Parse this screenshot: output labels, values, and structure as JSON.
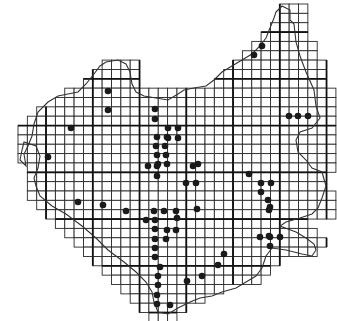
{
  "map": {
    "type": "grid-distribution-map",
    "background": "#ffffff",
    "grid_color": "#2a2a2a",
    "dot_color": "#1a1a1a",
    "grid": {
      "origin_x": 18,
      "origin_y": 4,
      "cell": 9.35,
      "major_every": 5,
      "rows": [
        {
          "row": 0,
          "from_col": 28,
          "to_col": 30
        },
        {
          "row": 1,
          "from_col": 28,
          "to_col": 30
        },
        {
          "row": 2,
          "from_col": 27,
          "to_col": 30
        },
        {
          "row": 3,
          "from_col": 26,
          "to_col": 30
        },
        {
          "row": 4,
          "from_col": 25,
          "to_col": 31
        },
        {
          "row": 5,
          "from_col": 24,
          "to_col": 31
        },
        {
          "row": 6,
          "from_col": 9,
          "to_col": 12
        },
        {
          "row": 6,
          "from_col": 23,
          "to_col": 32
        },
        {
          "row": 7,
          "from_col": 8,
          "to_col": 12
        },
        {
          "row": 7,
          "from_col": 22,
          "to_col": 32
        },
        {
          "row": 8,
          "from_col": 7,
          "to_col": 12
        },
        {
          "row": 8,
          "from_col": 21,
          "to_col": 32
        },
        {
          "row": 9,
          "from_col": 5,
          "to_col": 33
        },
        {
          "row": 10,
          "from_col": 4,
          "to_col": 33
        },
        {
          "row": 11,
          "from_col": 2,
          "to_col": 33
        },
        {
          "row": 12,
          "from_col": 1,
          "to_col": 33
        },
        {
          "row": 13,
          "from_col": 0,
          "to_col": 33
        },
        {
          "row": 14,
          "from_col": 0,
          "to_col": 33
        },
        {
          "row": 15,
          "from_col": 0,
          "to_col": 33
        },
        {
          "row": 16,
          "from_col": 0,
          "to_col": 33
        },
        {
          "row": 17,
          "from_col": 1,
          "to_col": 33
        },
        {
          "row": 18,
          "from_col": 1,
          "to_col": 32
        },
        {
          "row": 19,
          "from_col": 1,
          "to_col": 32
        },
        {
          "row": 20,
          "from_col": 1,
          "to_col": 33
        },
        {
          "row": 21,
          "from_col": 2,
          "to_col": 33
        },
        {
          "row": 22,
          "from_col": 3,
          "to_col": 33
        },
        {
          "row": 23,
          "from_col": 4,
          "to_col": 30
        },
        {
          "row": 24,
          "from_col": 5,
          "to_col": 31
        },
        {
          "row": 25,
          "from_col": 6,
          "to_col": 32
        },
        {
          "row": 26,
          "from_col": 7,
          "to_col": 31
        },
        {
          "row": 27,
          "from_col": 8,
          "to_col": 27
        },
        {
          "row": 28,
          "from_col": 9,
          "to_col": 26
        },
        {
          "row": 29,
          "from_col": 10,
          "to_col": 25
        },
        {
          "row": 30,
          "from_col": 11,
          "to_col": 21
        },
        {
          "row": 31,
          "from_col": 12,
          "to_col": 19
        },
        {
          "row": 32,
          "from_col": 13,
          "to_col": 17
        },
        {
          "row": 33,
          "from_col": 14,
          "to_col": 16
        }
      ]
    },
    "dots": [
      [
        262,
        46
      ],
      [
        254,
        55
      ],
      [
        108,
        91
      ],
      [
        108,
        110
      ],
      [
        71,
        128
      ],
      [
        168,
        128
      ],
      [
        155,
        109
      ],
      [
        155,
        119
      ],
      [
        178,
        128
      ],
      [
        168,
        138
      ],
      [
        178,
        138
      ],
      [
        157,
        137
      ],
      [
        167,
        137
      ],
      [
        156,
        146
      ],
      [
        165,
        146
      ],
      [
        157,
        155
      ],
      [
        166,
        155
      ],
      [
        158,
        164
      ],
      [
        167,
        164
      ],
      [
        148,
        166
      ],
      [
        157,
        166
      ],
      [
        157,
        176
      ],
      [
        198,
        164
      ],
      [
        48,
        157
      ],
      [
        289,
        116
      ],
      [
        298,
        116
      ],
      [
        308,
        116
      ],
      [
        249,
        174
      ],
      [
        186,
        183
      ],
      [
        196,
        183
      ],
      [
        261,
        183
      ],
      [
        271,
        183
      ],
      [
        261,
        192
      ],
      [
        78,
        202
      ],
      [
        126,
        211
      ],
      [
        154,
        211
      ],
      [
        164,
        211
      ],
      [
        176,
        211
      ],
      [
        146,
        220
      ],
      [
        155,
        220
      ],
      [
        155,
        229
      ],
      [
        197,
        209
      ],
      [
        155,
        239
      ],
      [
        166,
        239
      ],
      [
        177,
        218
      ],
      [
        155,
        248
      ],
      [
        155,
        257
      ],
      [
        176,
        230
      ],
      [
        167,
        230
      ],
      [
        268,
        200
      ],
      [
        270,
        207
      ],
      [
        269,
        236
      ],
      [
        270,
        246
      ],
      [
        269,
        210
      ],
      [
        160,
        267
      ],
      [
        158,
        276
      ],
      [
        158,
        285
      ],
      [
        157,
        295
      ],
      [
        157,
        304
      ],
      [
        260,
        237
      ],
      [
        270,
        237
      ],
      [
        280,
        237
      ],
      [
        224,
        254
      ],
      [
        218,
        265
      ],
      [
        202,
        276
      ],
      [
        187,
        281
      ],
      [
        170,
        305
      ],
      [
        193,
        166
      ],
      [
        103,
        205
      ]
    ],
    "border_path": "M276,12 L282,6 L290,10 L290,20 L294,24 L296,42 L300,56 L306,72 L314,90 L316,106 L320,118 L312,128 L300,132 L296,140 L298,152 L306,160 L312,168 L322,172 L326,186 L322,198 L318,208 L312,214 L300,218 L286,222 L280,226 L296,232 L306,238 L314,244 L316,250 L312,256 L302,254 L286,250 L272,248 L266,256 L262,268 L256,276 L246,282 L236,288 L222,292 L212,296 L200,298 L190,302 L178,308 L168,314 L158,312 L154,302 L152,292 L146,282 L136,272 L124,262 L108,250 L96,238 L82,226 L66,214 L52,206 L40,196 L36,186 L34,178 L38,168 L40,156 L36,146 L24,142 L22,150 L20,160 L26,166 L24,154 L28,146 L32,136 L34,124 L38,112 L48,102 L58,96 L68,94 L78,92 L86,84 L94,74 L100,66 L106,62 L118,60 L126,64 L130,72 L132,84 L136,92 L144,96 L156,98 L168,100 L178,94 L184,90 L194,88 L206,86 L214,80 L222,72 L232,66 L242,60 L252,54 L260,46 L266,38 L270,28 L274,18 Z"
  }
}
